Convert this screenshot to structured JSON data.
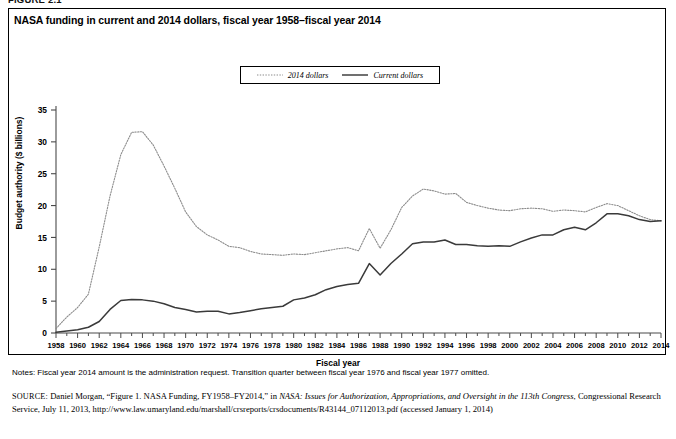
{
  "figure": {
    "label": "FIGURE 2.1",
    "title": "NASA funding in current and 2014 dollars, fiscal year 1958–fiscal year 2014"
  },
  "legend": {
    "items": [
      {
        "label": "2014 dollars",
        "style": "dotted",
        "color": "#888888"
      },
      {
        "label": "Current dollars",
        "style": "solid",
        "color": "#333333"
      }
    ]
  },
  "axes": {
    "y_title": "Budget authority ($ billions)",
    "x_title": "Fiscal year",
    "y_ticks": [
      "0",
      "5",
      "10",
      "15",
      "20",
      "25",
      "30",
      "35"
    ],
    "x_ticks": [
      "1958",
      "1960",
      "1962",
      "1964",
      "1966",
      "1968",
      "1970",
      "1972",
      "1974",
      "1976",
      "1978",
      "1980",
      "1982",
      "1984",
      "1986",
      "1988",
      "1990",
      "1992",
      "1994",
      "1996",
      "1998",
      "2000",
      "2002",
      "2004",
      "2006",
      "2008",
      "2010",
      "2012",
      "2014"
    ]
  },
  "notes": {
    "text": "Notes: Fiscal year 2014 amount is the administration request. Transition quarter between fiscal year 1976 and fiscal year 1977 omitted."
  },
  "source": {
    "prefix": "SOURCE:",
    "author": " Daniel Morgan, “Figure 1. NASA Funding, FY1958–FY2014,” in ",
    "italic_title": "NASA: Issues for Authorization, Appropriations, and Oversight in the 113th Congress",
    "rest": ", Congressional Research Service, July 11, 2013, http://www.law.umaryland.edu/marshall/crsreports/crsdocuments/R43144_07112013.pdf (accessed January 1, 2014)"
  },
  "chart_data": {
    "type": "line",
    "title": "NASA funding in current and 2014 dollars, fiscal year 1958–fiscal year 2014",
    "xlabel": "Fiscal year",
    "ylabel": "Budget authority ($ billions)",
    "xlim": [
      1958,
      2014
    ],
    "ylim": [
      0,
      35
    ],
    "grid": false,
    "legend_position": "top-center",
    "x": [
      1958,
      1959,
      1960,
      1961,
      1962,
      1963,
      1964,
      1965,
      1966,
      1967,
      1968,
      1969,
      1970,
      1971,
      1972,
      1973,
      1974,
      1975,
      1976,
      1977,
      1978,
      1979,
      1980,
      1981,
      1982,
      1983,
      1984,
      1985,
      1986,
      1987,
      1988,
      1989,
      1990,
      1991,
      1992,
      1993,
      1994,
      1995,
      1996,
      1997,
      1998,
      1999,
      2000,
      2001,
      2002,
      2003,
      2004,
      2005,
      2006,
      2007,
      2008,
      2009,
      2010,
      2011,
      2012,
      2013,
      2014
    ],
    "series": [
      {
        "name": "2014 dollars",
        "style": "dotted",
        "color": "#8c8c8c",
        "values": [
          0.7,
          2.5,
          4.0,
          6.1,
          13.5,
          21.5,
          28.0,
          31.5,
          31.6,
          29.5,
          26.2,
          22.7,
          19.0,
          16.7,
          15.4,
          14.6,
          13.6,
          13.4,
          12.8,
          12.4,
          12.3,
          12.2,
          12.4,
          12.3,
          12.6,
          12.9,
          13.2,
          13.4,
          12.9,
          16.4,
          13.3,
          16.2,
          19.7,
          21.5,
          22.6,
          22.3,
          21.8,
          21.9,
          20.5,
          20.0,
          19.6,
          19.3,
          19.2,
          19.5,
          19.6,
          19.5,
          19.1,
          19.3,
          19.2,
          19.0,
          19.7,
          20.3,
          20.0,
          19.2,
          18.4,
          17.8,
          17.6
        ]
      },
      {
        "name": "Current dollars",
        "style": "solid",
        "color": "#3a3a3a",
        "values": [
          0.1,
          0.3,
          0.5,
          0.9,
          1.8,
          3.7,
          5.1,
          5.25,
          5.2,
          5.0,
          4.6,
          4.0,
          3.7,
          3.3,
          3.4,
          3.4,
          3.0,
          3.2,
          3.5,
          3.8,
          4.0,
          4.2,
          5.2,
          5.5,
          6.0,
          6.8,
          7.3,
          7.6,
          7.8,
          10.9,
          9.1,
          10.9,
          12.4,
          14.0,
          14.3,
          14.3,
          14.6,
          13.9,
          13.9,
          13.7,
          13.6,
          13.7,
          13.6,
          14.3,
          14.9,
          15.4,
          15.4,
          16.2,
          16.6,
          16.2,
          17.3,
          18.7,
          18.7,
          18.4,
          17.8,
          17.5,
          17.6
        ]
      }
    ]
  }
}
